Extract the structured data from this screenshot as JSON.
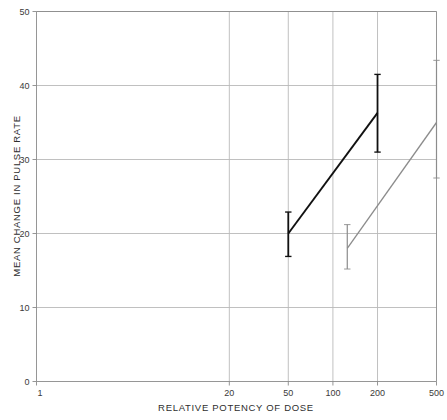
{
  "chart_data": {
    "type": "line",
    "title": "",
    "xlabel": "RELATIVE POTENCY OF DOSE",
    "ylabel": "MEAN CHANGE IN PULSE RATE",
    "xscale": "log",
    "yscale": "linear",
    "xlim": [
      1,
      500
    ],
    "ylim": [
      0,
      50
    ],
    "xticks": [
      1,
      20,
      50,
      100,
      200,
      500
    ],
    "xtick_labels": [
      "1",
      "20",
      "50",
      "100",
      "200",
      "500"
    ],
    "yticks": [
      0,
      10,
      20,
      30,
      40,
      50
    ],
    "ytick_labels": [
      "0",
      "10",
      "20",
      "30",
      "40",
      "50"
    ],
    "grid": true,
    "legend": "none",
    "series": [
      {
        "name": "series-black",
        "color": "#111111",
        "x": [
          50,
          200
        ],
        "values": [
          20.0,
          36.3
        ],
        "errors_low": [
          16.9,
          31.0
        ],
        "errors_high": [
          22.9,
          41.5
        ]
      },
      {
        "name": "series-gray",
        "color": "#8c8c8c",
        "x": [
          125,
          500
        ],
        "values": [
          18.0,
          35.0
        ],
        "errors_low": [
          15.2,
          27.5
        ],
        "errors_high": [
          21.2,
          43.4
        ]
      }
    ]
  },
  "axes": {
    "y_tick_0": "0",
    "y_tick_10": "10",
    "y_tick_20": "20",
    "y_tick_30": "30",
    "y_tick_40": "40",
    "y_tick_50": "50",
    "x_tick_1": "1",
    "x_tick_20": "20",
    "x_tick_50": "50",
    "x_tick_100": "100",
    "x_tick_200": "200",
    "x_tick_500": "500",
    "x_title": "RELATIVE POTENCY OF DOSE",
    "y_title": "MEAN CHANGE IN PULSE RATE"
  },
  "colors": {
    "series_black": "#111111",
    "series_gray": "#8c8c8c",
    "grid": "#b9b9b9",
    "frame": "#8a8a8a",
    "text": "#2e2e2e",
    "background": "#ffffff"
  }
}
